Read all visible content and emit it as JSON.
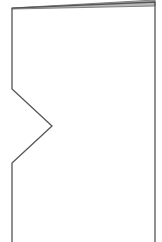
{
  "diagram": {
    "shape": "notched-page-outline",
    "colors": {
      "background": "#ffffff",
      "stroke": "#555555",
      "fold_fill": "#b8b8b8",
      "fold_stroke": "#6a6a6a"
    },
    "stroke_width": 1.3,
    "outline_points": [
      [
        12,
        242
      ],
      [
        12,
        163
      ],
      [
        52,
        126
      ],
      [
        12,
        89
      ],
      [
        12,
        8
      ],
      [
        155,
        2
      ],
      [
        155,
        242
      ]
    ],
    "fold_points": [
      [
        12,
        8
      ],
      [
        155,
        0
      ],
      [
        155,
        6
      ],
      [
        12,
        9
      ]
    ],
    "notch": {
      "top": [
        12,
        89
      ],
      "apex": [
        52,
        126
      ],
      "bottom": [
        12,
        163
      ]
    }
  }
}
